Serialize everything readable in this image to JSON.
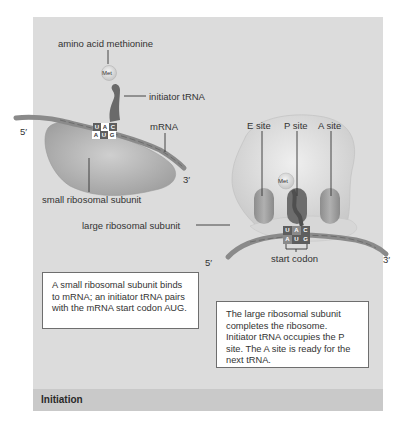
{
  "diagram": {
    "footer_title": "Initiation",
    "stage1": {
      "labels": {
        "amino_acid": "amino acid methionine",
        "met": "Met",
        "initiator_trna": "initiator tRNA",
        "mrna": "mRNA",
        "five_prime": "5′",
        "three_prime": "3′",
        "small_subunit": "small ribosomal subunit"
      },
      "anticodon": [
        "U",
        "A",
        "C"
      ],
      "codon": [
        "A",
        "U",
        "G"
      ],
      "caption": "A small ribosomal subunit binds to mRNA; an initiator tRNA pairs with the mRNA start codon AUG."
    },
    "stage2": {
      "labels": {
        "e_site": "E site",
        "p_site": "P site",
        "a_site": "A site",
        "met": "Met",
        "large_subunit": "large ribosomal subunit",
        "start_codon": "start codon",
        "five_prime": "5′",
        "three_prime": "3′"
      },
      "anticodon": [
        "U",
        "A",
        "C"
      ],
      "codon": [
        "A",
        "U",
        "G"
      ],
      "caption": "The large ribosomal subunit completes the ribosome. Initiator tRNA occupies the P site. The A site is ready for the next tRNA."
    },
    "colors": {
      "panel_bg": "#dcdcdc",
      "footer_bg": "#c9c9c9",
      "subunit": "#b5b5b5",
      "large_subunit": "#e6e6e6",
      "trna": "#6a6a6a",
      "mrna": "#8a8a8a"
    }
  }
}
